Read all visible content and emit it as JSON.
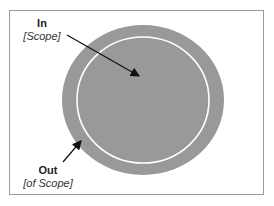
{
  "diagram": {
    "type": "scope-ellipse",
    "colors": {
      "outer_fill": "#999999",
      "inner_ring": "#ffffff",
      "frame": "#9a9a9a",
      "arrow": "#111111"
    },
    "labels": {
      "in": {
        "title": "In",
        "subtitle": "[Scope]"
      },
      "out": {
        "title": "Out",
        "subtitle": "[of Scope]"
      }
    }
  }
}
